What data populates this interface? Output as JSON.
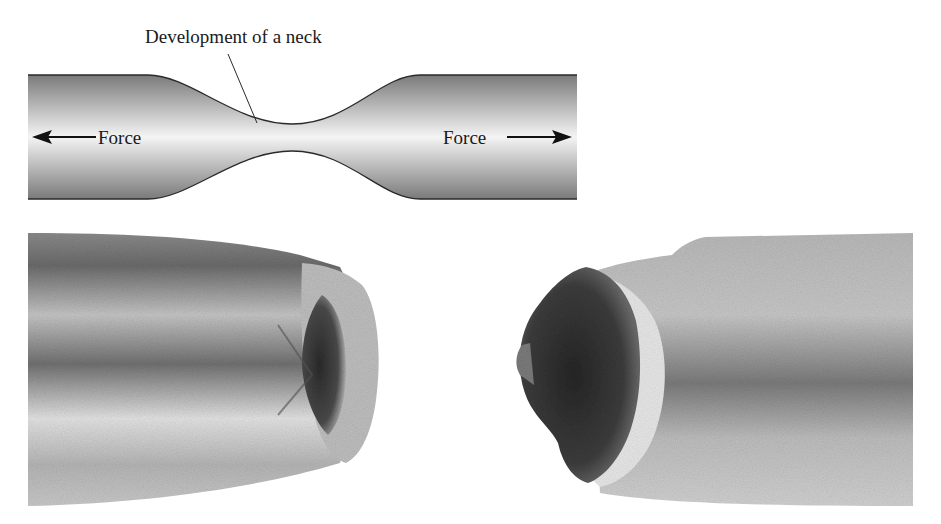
{
  "diagram": {
    "neck_label": "Development of a neck",
    "force_left_label": "Force",
    "force_right_label": "Force",
    "force_left_direction": "left",
    "force_right_direction": "right",
    "icons": {
      "force_left_arrow": "arrow-left-icon",
      "force_right_arrow": "arrow-right-icon"
    },
    "colors": {
      "bar_edge": "#7a7a7a",
      "bar_center": "#f4f4f4",
      "outline": "#2a2a2a",
      "text": "#1a1a1a"
    }
  },
  "photos": {
    "left_specimen": {
      "description": "fractured tensile specimen, cup side"
    },
    "right_specimen": {
      "description": "fractured tensile specimen, cone side"
    },
    "colors": {
      "metal_light": "#d8d8d8",
      "metal_mid": "#a6a6a6",
      "metal_dark": "#5e5e5e",
      "fracture_dark": "#2e2e2e"
    }
  }
}
